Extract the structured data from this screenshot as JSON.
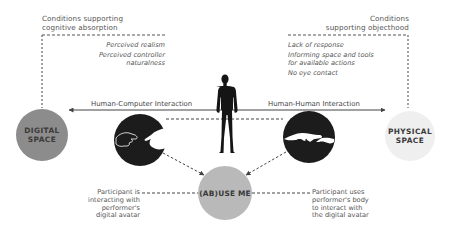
{
  "left_conditions": {
    "title_line1": "Conditions supporting",
    "title_line2": "cognitive absorption",
    "items": [
      "Perceived realism",
      "Perceived controller",
      "naturalness"
    ]
  },
  "right_conditions": {
    "title_line1": "Conditions",
    "title_line2": "supporting objecthood",
    "items": [
      "Lack of response",
      "Informing space and tools",
      "for available actions",
      "No eye contact"
    ]
  },
  "nodes": {
    "digital": {
      "line1": "DIGITAL",
      "line2": "SPACE",
      "color": "#8c8c8c"
    },
    "physical": {
      "line1": "PHYSICAL",
      "line2": "SPACE",
      "color": "#efefef"
    },
    "center": {
      "label": "(AB)USE ME",
      "color": "#b9b9b9"
    }
  },
  "edges": {
    "hci": "Human-Computer Interaction",
    "hhi": "Human-Human Interaction"
  },
  "notes": {
    "left": [
      "Participant is",
      "interacting with",
      "performer's",
      "digital avatar"
    ],
    "right": [
      "Participant uses",
      "performer's body",
      "to interact with",
      "the digital avatar"
    ]
  },
  "icons": {
    "figure": "human-silhouette-icon",
    "left_hands": "hands-touching-digital-icon",
    "right_hands": "hands-touching-physical-icon"
  },
  "colors": {
    "line": "#444444",
    "dark": "#1c1c1c"
  }
}
